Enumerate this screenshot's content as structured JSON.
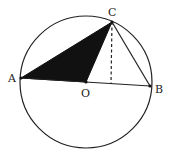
{
  "diagram": {
    "type": "geometry",
    "circle": {
      "center": "O",
      "cx": 86,
      "cy": 82,
      "r": 66
    },
    "points": {
      "A": {
        "label": "A",
        "x": 21,
        "y": 78
      },
      "B": {
        "label": "B",
        "x": 150,
        "y": 86
      },
      "C": {
        "label": "C",
        "x": 112,
        "y": 22
      },
      "O": {
        "label": "O",
        "x": 86,
        "y": 82
      },
      "H": {
        "label": "",
        "x": 111,
        "y": 84
      }
    },
    "segments": [
      {
        "from": "A",
        "to": "B",
        "style": "solid"
      },
      {
        "from": "A",
        "to": "C",
        "style": "solid"
      },
      {
        "from": "O",
        "to": "C",
        "style": "solid"
      },
      {
        "from": "C",
        "to": "B",
        "style": "solid"
      },
      {
        "from": "C",
        "to": "H",
        "style": "dashed"
      }
    ],
    "shaded_region": {
      "polygon": [
        "A",
        "O",
        "C"
      ],
      "color": "#111111"
    }
  }
}
